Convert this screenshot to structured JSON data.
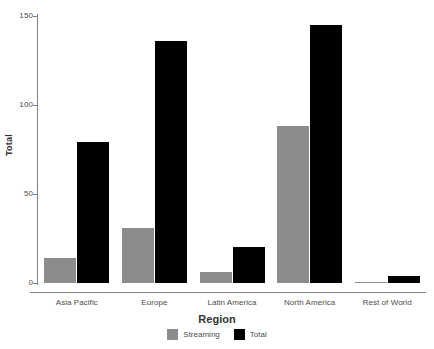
{
  "chart_data": {
    "type": "bar",
    "title": "",
    "xlabel": "Region",
    "ylabel": "Total",
    "categories": [
      "Asia Pacific",
      "Europe",
      "Latin America",
      "North America",
      "Rest of World"
    ],
    "series": [
      {
        "name": "Streaming",
        "color": "#8c8c8c",
        "values": [
          14,
          31,
          6,
          88,
          0.5
        ]
      },
      {
        "name": "Total",
        "color": "#000000",
        "values": [
          79,
          136,
          20,
          145,
          4
        ]
      }
    ],
    "ylim": [
      0,
      150
    ],
    "yticks": [
      0,
      50,
      100,
      150
    ],
    "ytick_labels": [
      "0",
      "50",
      "100",
      "150"
    ],
    "grid": false,
    "legend_position": "bottom",
    "axis_color": "#7f7f7f",
    "background": "#ffffff"
  },
  "axes": {
    "y_title": "Total",
    "x_title": "Region"
  },
  "legend": {
    "items": [
      {
        "label": "Streaming",
        "color": "#8c8c8c"
      },
      {
        "label": "Total",
        "color": "#000000"
      }
    ]
  }
}
